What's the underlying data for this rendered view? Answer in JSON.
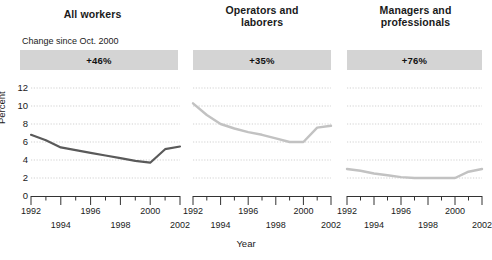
{
  "axis": {
    "ylabel": "Percent",
    "xlabel": "Year",
    "yticks": [
      "0",
      "2",
      "4",
      "6",
      "8",
      "10",
      "12"
    ],
    "xticks_row0": [
      "1992",
      "1996",
      "2000"
    ],
    "xticks_row1": [
      "1994",
      "1998",
      "2002"
    ]
  },
  "panels": [
    {
      "title": "All workers",
      "caption": "Change since Oct. 2000",
      "change": "+46%",
      "line_color": "#5a5a5a"
    },
    {
      "title": "Operators and laborers",
      "title_line1": "Operators and",
      "title_line2": "laborers",
      "caption": "",
      "change": "+35%",
      "line_color": "#c2c2c2"
    },
    {
      "title": "Managers and professionals",
      "title_line1": "Managers and",
      "title_line2": "professionals",
      "caption": "",
      "change": "+76%",
      "line_color": "#c2c2c2"
    }
  ],
  "chart_data": {
    "type": "line",
    "title": "",
    "xlabel": "Year",
    "ylabel": "Percent",
    "xlim": [
      1992,
      2002
    ],
    "ylim": [
      0,
      12
    ],
    "yticks": [
      0,
      2,
      4,
      6,
      8,
      10,
      12
    ],
    "xticks": [
      1992,
      1993,
      1994,
      1995,
      1996,
      1997,
      1998,
      1999,
      2000,
      2001,
      2002
    ],
    "grid": "horizontal-dotted",
    "legend": "none",
    "x": [
      1992,
      1993,
      1994,
      1995,
      1996,
      1997,
      1998,
      1999,
      2000,
      2001,
      2002
    ],
    "series": [
      {
        "name": "All workers",
        "panel": "All workers",
        "annotation": "+46%",
        "values": [
          6.8,
          6.2,
          5.4,
          5.1,
          4.8,
          4.5,
          4.2,
          3.9,
          3.7,
          5.2,
          5.5
        ]
      },
      {
        "name": "Operators and laborers",
        "panel": "Operators and laborers",
        "annotation": "+35%",
        "values": [
          10.3,
          9.0,
          8.0,
          7.5,
          7.1,
          6.8,
          6.4,
          6.0,
          6.0,
          7.6,
          7.8
        ]
      },
      {
        "name": "Managers and professionals",
        "panel": "Managers and professionals",
        "annotation": "+76%",
        "values": [
          3.0,
          2.8,
          2.5,
          2.3,
          2.1,
          2.0,
          2.0,
          2.0,
          2.0,
          2.7,
          3.0
        ]
      }
    ]
  }
}
